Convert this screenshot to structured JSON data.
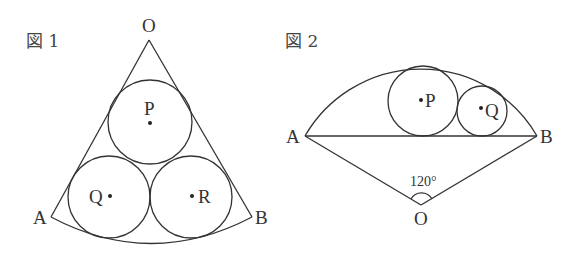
{
  "figure1": {
    "title": "図 1",
    "labels": {
      "O": "O",
      "A": "A",
      "B": "B",
      "P": "P",
      "Q": "Q",
      "R": "R"
    }
  },
  "figure2": {
    "title": "図 2",
    "labels": {
      "O": "O",
      "A": "A",
      "B": "B",
      "P": "P",
      "Q": "Q"
    },
    "angle_label": "120°"
  },
  "colors": {
    "line": "#333333",
    "background": "#ffffff"
  }
}
